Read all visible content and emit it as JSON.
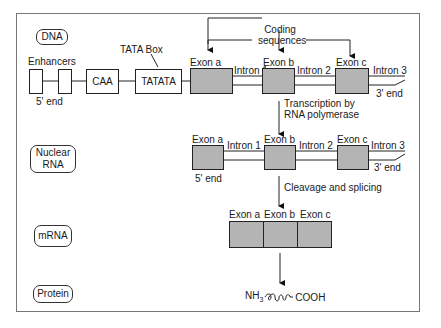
{
  "stages": {
    "dna": "DNA",
    "nuclear_rna_line1": "Nuclear",
    "nuclear_rna_line2": "RNA",
    "mrna": "mRNA",
    "protein": "Protein"
  },
  "dna": {
    "enhancers": "Enhancers",
    "five_prime": "5' end",
    "caa": "CAA",
    "tata_box_label": "TATA Box",
    "tatata": "TATATA",
    "coding_line1": "Coding",
    "coding_line2": "sequences",
    "exons": [
      "Exon a",
      "Exon b",
      "Exon c"
    ],
    "introns": [
      "Intron 1",
      "Intron 2",
      "Intron 3"
    ],
    "three_prime": "3' end"
  },
  "steps": {
    "transcription_line1": "Transcription by",
    "transcription_line2": "RNA polymerase",
    "cleavage": "Cleavage and splicing"
  },
  "nuclear_rna": {
    "exons": [
      "Exon a",
      "Exon b",
      "Exon c"
    ],
    "introns": [
      "Intron 1",
      "Intron 2",
      "Intron 3"
    ],
    "five_prime": "5' end",
    "three_prime": "3' end"
  },
  "mrna": {
    "exons": [
      "Exon a",
      "Exon b",
      "Exon c"
    ]
  },
  "protein": {
    "n_term": "NH",
    "n_sub": "3",
    "c_term": "COOH"
  },
  "colors": {
    "exon_fill": "#b4b4b4",
    "line": "#222222",
    "frame": "#777777"
  }
}
